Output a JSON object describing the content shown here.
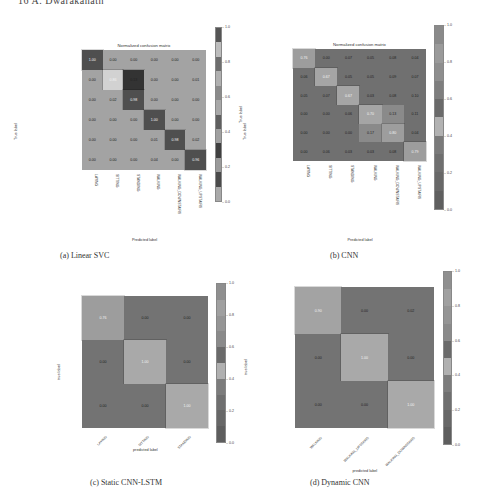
{
  "page_header": "16      A. Dwarakanath",
  "chart_data": [
    {
      "id": "a",
      "type": "heatmap",
      "title": "Normalized confusion matrix",
      "caption": "(a)  Linear SVC",
      "xlabel": "Predicted label",
      "ylabel": "True label",
      "colorbar_label": "True label",
      "row_labels": [
        "LAYING",
        "SITTING",
        "STANDING",
        "WALKING",
        "WALKING_DOWNSTAIRS",
        "WALKING_UPSTAIRS"
      ],
      "col_labels": [
        "LAYING",
        "SITTING",
        "STANDING",
        "WALKING",
        "WALKING_DOWNSTAIRS",
        "WALKING_UPSTAIRS"
      ],
      "values": [
        [
          1.0,
          0.0,
          0.0,
          0.0,
          0.0,
          0.0
        ],
        [
          0.0,
          0.86,
          0.13,
          0.0,
          0.0,
          0.01
        ],
        [
          0.0,
          0.02,
          0.98,
          0.0,
          0.0,
          0.0
        ],
        [
          0.0,
          0.0,
          0.0,
          1.0,
          0.0,
          0.0
        ],
        [
          0.0,
          0.0,
          0.0,
          0.01,
          0.98,
          0.02
        ],
        [
          0.0,
          0.0,
          0.0,
          0.04,
          0.0,
          0.96
        ]
      ],
      "colorbar_ticks": [
        "1.0",
        "0.8",
        "0.6",
        "0.4",
        "0.2",
        "0.0"
      ],
      "vlim": [
        0,
        1
      ]
    },
    {
      "id": "b",
      "type": "heatmap",
      "title": "Normalized confusion matrix",
      "caption": "(b)  CNN",
      "xlabel": "Predicted label",
      "ylabel": "True label",
      "row_labels": [
        "LAYING",
        "SITTING",
        "STANDING",
        "WALKING",
        "WALKING_DOWNSTAIRS",
        "WALKING_UPSTAIRS"
      ],
      "col_labels": [
        "LAYING",
        "SITTING",
        "STANDING",
        "WALKING",
        "WALKING_DOWNSTAIRS",
        "WALKING_UPSTAIRS"
      ],
      "values": [
        [
          0.76,
          0.0,
          0.07,
          0.05,
          0.08,
          0.04
        ],
        [
          0.06,
          0.67,
          0.05,
          0.05,
          0.09,
          0.07
        ],
        [
          0.05,
          0.07,
          0.67,
          0.03,
          0.08,
          0.1
        ],
        [
          0.0,
          0.0,
          0.06,
          0.7,
          0.13,
          0.11
        ],
        [
          0.0,
          0.0,
          0.0,
          0.17,
          0.8,
          0.04
        ],
        [
          0.0,
          0.06,
          0.03,
          0.03,
          0.08,
          0.79
        ]
      ],
      "colorbar_ticks": [
        "1.0",
        "0.8",
        "0.6",
        "0.4",
        "0.2",
        "0.0"
      ],
      "vlim": [
        0,
        1
      ]
    },
    {
      "id": "c",
      "type": "heatmap",
      "title": "",
      "caption": "(c)  Static CNN-LSTM",
      "xlabel": "predicted label",
      "ylabel": "true label",
      "colorbar_label": "true label",
      "row_labels": [
        "LAYING",
        "SITTING",
        "STANDING"
      ],
      "col_labels": [
        "LAYING",
        "SITTING",
        "STANDING"
      ],
      "values": [
        [
          0.76,
          0.0,
          0.0
        ],
        [
          0.0,
          1.0,
          0.0
        ],
        [
          0.0,
          0.0,
          1.0
        ]
      ],
      "colorbar_ticks": [
        "1.0",
        "0.8",
        "0.6",
        "0.4",
        "0.2",
        "0.0"
      ],
      "vlim": [
        0,
        1
      ]
    },
    {
      "id": "d",
      "type": "heatmap",
      "title": "",
      "caption": "(d)  Dynamic CNN",
      "xlabel": "predicted label",
      "ylabel": "true label",
      "row_labels": [
        "WALKING",
        "WALKING_UPSTAIRS",
        "WALKING_DOWNSTAIRS"
      ],
      "col_labels": [
        "WALKING",
        "WALKING_UPSTAIRS",
        "WALKING_DOWNSTAIRS"
      ],
      "values": [
        [
          0.9,
          0.0,
          0.02
        ],
        [
          0.0,
          1.0,
          0.0
        ],
        [
          0.0,
          0.0,
          1.0
        ]
      ],
      "colorbar_ticks": [
        "1.0",
        "0.8",
        "0.6",
        "0.4",
        "0.2",
        "0.0"
      ],
      "vlim": [
        0,
        1
      ]
    }
  ],
  "palettes": {
    "a": {
      "bg": "#a3a3a3",
      "bands": [
        "#555555",
        "#bdbdbd",
        "#6e6e6e",
        "#b0b0b0",
        "#8a8a8a",
        "#a8a8a8",
        "#5f5f5f",
        "#a0a0a0",
        "#3f3f3f",
        "#9a9a9a",
        "#4a4a4a",
        "#a9a9a9"
      ]
    },
    "b": {
      "bg": "#707070",
      "bands": [
        "#8a8a8a",
        "#9a9a9a",
        "#8e8e8e",
        "#7e7e7e",
        "#6a6a6a",
        "#b2b2b2",
        "#7a7a7a",
        "#6f6f6f",
        "#686868",
        "#5f5f5f"
      ]
    },
    "c": {
      "bg": "#737373",
      "bands": [
        "#8f8f8f",
        "#a0a0a0",
        "#959595",
        "#8a8a8a",
        "#6a6a6a",
        "#b0b0b0",
        "#7c7c7c",
        "#6f6f6f",
        "#676767",
        "#5e5e5e"
      ]
    },
    "d": {
      "bg": "#737373",
      "bands": [
        "#8f8f8f",
        "#a0a0a0",
        "#959595",
        "#8a8a8a",
        "#6a6a6a",
        "#b0b0b0",
        "#7c7c7c",
        "#6f6f6f",
        "#676767",
        "#5e5e5e"
      ]
    }
  }
}
